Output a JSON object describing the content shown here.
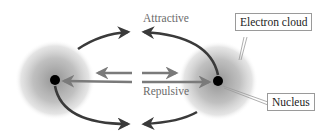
{
  "labels": {
    "attractive": "Attractive",
    "repulsive": "Repulsive",
    "electron_cloud": "Electron cloud",
    "nucleus": "Nucleus"
  },
  "colors": {
    "attractive_arrow": "#3a3a3a",
    "repulsive_arrow": "#7a7a7a",
    "nucleus": "#000000",
    "cloud_center": "#9a9a9a"
  },
  "atoms": [
    {
      "name": "left-atom",
      "cx": 55,
      "cy": 80
    },
    {
      "name": "right-atom",
      "cx": 218,
      "cy": 81
    }
  ]
}
